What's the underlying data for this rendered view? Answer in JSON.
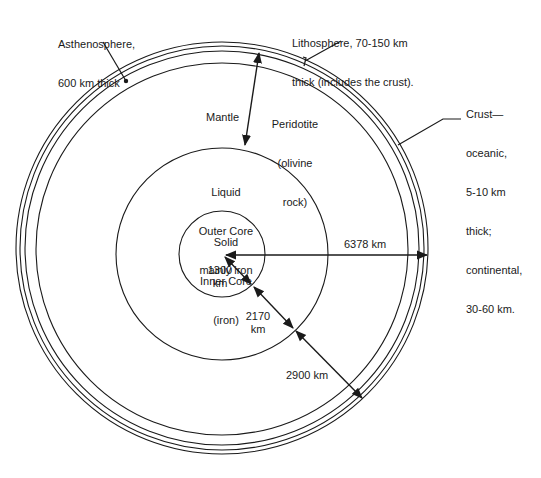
{
  "diagram": {
    "type": "earth-cross-section",
    "layers": [
      {
        "name": "Crust",
        "lines": [
          "Crust—",
          "oceanic,",
          "5-10 km",
          "thick;",
          "continental,",
          "30-60 km."
        ]
      },
      {
        "name": "Lithosphere",
        "lines": [
          "Lithosphere, 70-150 km",
          "thick (includes the crust)."
        ]
      },
      {
        "name": "Asthenosphere",
        "lines": [
          "Asthenosphere,",
          "600 km thick"
        ]
      },
      {
        "name": "Mantle",
        "lines": [
          "Mantle"
        ]
      },
      {
        "name": "Peridotite",
        "lines": [
          "Peridotite",
          "(olivine",
          "rock)"
        ]
      },
      {
        "name": "Outer Core",
        "lines": [
          "Liquid",
          "Outer Core",
          "mainly iron"
        ]
      },
      {
        "name": "Inner Core",
        "lines": [
          "Solid",
          "Inner Core",
          "(iron)"
        ]
      }
    ],
    "dimensions": {
      "inner_core_radius": "1300\nkm",
      "outer_core_thickness": "2170\nkm",
      "mantle_thickness": "2900 km",
      "earth_radius": "6378 km"
    },
    "colors": {
      "stroke": "#1a1a1a",
      "background": "#ffffff"
    }
  }
}
